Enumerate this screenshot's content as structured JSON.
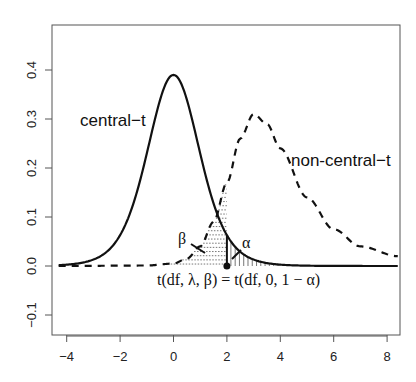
{
  "chart_data": {
    "type": "line",
    "title": "",
    "xlabel": "",
    "ylabel": "",
    "xlim": [
      -4.3,
      8.4
    ],
    "ylim": [
      -0.125,
      0.505
    ],
    "x_ticks": [
      -4,
      -2,
      0,
      2,
      4,
      6,
      8
    ],
    "x_tick_labels": [
      "-4",
      "-2",
      "0",
      "2",
      "4",
      "6",
      "8"
    ],
    "y_ticks": [
      -0.1,
      0.0,
      0.1,
      0.2,
      0.3,
      0.4
    ],
    "y_tick_labels": [
      "-0.1",
      "0.0",
      "0.1",
      "0.2",
      "0.3",
      "0.4"
    ],
    "grid": false,
    "legend": "none (curves labeled directly)",
    "series": [
      {
        "name": "central-t",
        "style": "solid",
        "peak": {
          "x": 0,
          "y": 0.39
        },
        "x": [
          -4.3,
          -4,
          -3,
          -2,
          -1.5,
          -1,
          -0.5,
          0,
          0.5,
          1,
          1.5,
          2,
          3,
          4,
          5,
          6,
          8.4
        ],
        "y": [
          0.004,
          0.006,
          0.018,
          0.06,
          0.12,
          0.23,
          0.34,
          0.39,
          0.34,
          0.23,
          0.12,
          0.06,
          0.018,
          0.006,
          0.003,
          0.002,
          0.001
        ]
      },
      {
        "name": "non-central-t",
        "style": "dashed",
        "peak": {
          "x": 3.0,
          "y": 0.31
        },
        "x": [
          -4.3,
          -1,
          0,
          0.5,
          1,
          1.5,
          2,
          2.5,
          3,
          3.5,
          4,
          5,
          6,
          7,
          8.4
        ],
        "y": [
          0.0,
          0.001,
          0.005,
          0.015,
          0.04,
          0.09,
          0.17,
          0.26,
          0.31,
          0.29,
          0.24,
          0.14,
          0.075,
          0.04,
          0.02
        ]
      }
    ],
    "annotations": [
      {
        "text": "central-t",
        "x": -1.9,
        "y": 0.29
      },
      {
        "text": "non-central-t",
        "x": 5.9,
        "y": 0.155
      },
      {
        "text": "β",
        "x": 1.1,
        "y": 0.07,
        "meaning": "shaded area under non-central-t left of the critical value (horizontal hatching)"
      },
      {
        "text": "α",
        "x": 2.9,
        "y": 0.07,
        "meaning": "shaded area under central-t right of the critical value (vertical hatching)"
      },
      {
        "text": "t(df, λ, β) = t(df, 0, 1 − α)",
        "x": 2.2,
        "y": -0.035,
        "meaning": "critical value marked by vertical line and point"
      }
    ],
    "critical_value": {
      "x": 2.0,
      "y": 0.0
    }
  },
  "labels": {
    "central": "central−t",
    "noncentral": "non-central−t",
    "beta": "β",
    "alpha": "α",
    "equation": "t(df, λ, β) = t(df, 0, 1 − α)"
  },
  "colors": {
    "line": "#111111",
    "axis": "#444444",
    "hatch": "#666666"
  }
}
